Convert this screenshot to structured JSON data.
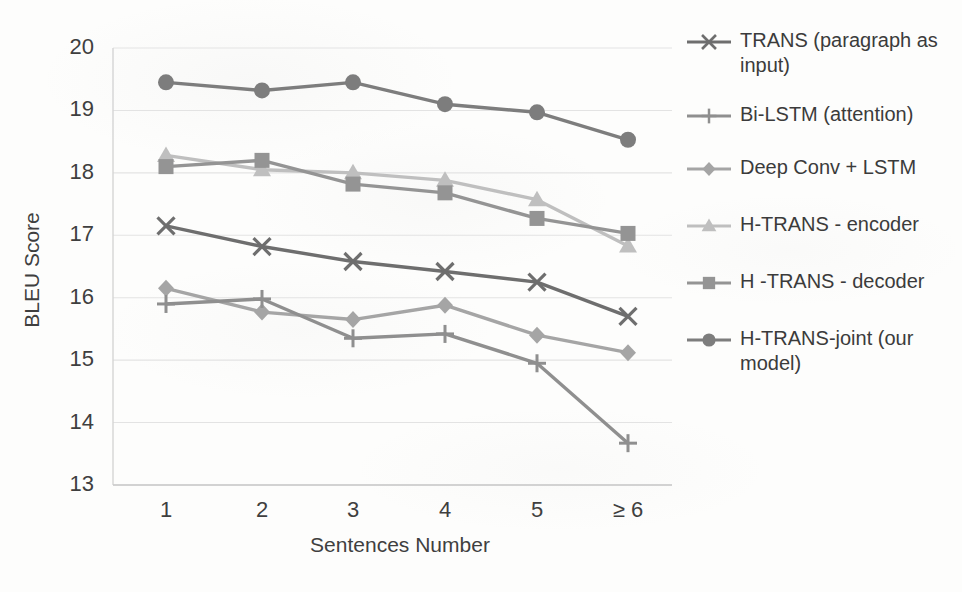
{
  "chart_data": {
    "type": "line",
    "title": "",
    "xlabel": "Sentences Number",
    "ylabel": "BLEU Score",
    "categories": [
      "1",
      "2",
      "3",
      "4",
      "5",
      "≥ 6"
    ],
    "ylim": [
      13,
      20
    ],
    "yticks": [
      "13",
      "14",
      "15",
      "16",
      "17",
      "18",
      "19",
      "20"
    ],
    "grid": true,
    "legend_position": "right",
    "series": [
      {
        "name": "TRANS (paragraph as input)",
        "marker": "x",
        "color": "#6e6e6e",
        "values": [
          17.15,
          16.82,
          16.58,
          16.42,
          16.25,
          15.7
        ]
      },
      {
        "name": "Bi-LSTM (attention)",
        "marker": "plus",
        "color": "#8f8f8f",
        "values": [
          15.9,
          15.98,
          15.35,
          15.42,
          14.95,
          13.67
        ]
      },
      {
        "name": "Deep Conv + LSTM",
        "marker": "diamond",
        "color": "#a5a5a5",
        "values": [
          16.15,
          15.77,
          15.65,
          15.88,
          15.4,
          15.12
        ]
      },
      {
        "name": "H-TRANS - encoder",
        "marker": "triangle",
        "color": "#bfbfbf",
        "values": [
          18.28,
          18.05,
          18.0,
          17.88,
          17.57,
          16.83
        ]
      },
      {
        "name": "H -TRANS - decoder",
        "marker": "square",
        "color": "#949494",
        "values": [
          18.1,
          18.2,
          17.82,
          17.68,
          17.27,
          17.03
        ]
      },
      {
        "name": "H-TRANS-joint (our model)",
        "marker": "circle",
        "color": "#7d7d7d",
        "values": [
          19.45,
          19.32,
          19.45,
          19.1,
          18.97,
          18.53
        ]
      }
    ],
    "gridline_color": "#e3e3e3",
    "axis_color": "#d5d5d5",
    "text_color": "#3f3f3f",
    "background": "#fdfdfc"
  }
}
